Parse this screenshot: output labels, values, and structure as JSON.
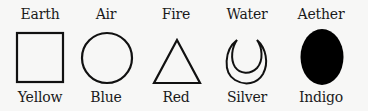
{
  "elements": [
    {
      "name": "Earth",
      "color": "Yellow",
      "symbol": "square",
      "x": 40
    },
    {
      "name": "Air",
      "color": "Blue",
      "symbol": "circle",
      "x": 106
    },
    {
      "name": "Fire",
      "color": "Red",
      "symbol": "triangle",
      "x": 176
    },
    {
      "name": "Water",
      "color": "Silver",
      "symbol": "crescent",
      "x": 247
    },
    {
      "name": "Aether",
      "color": "Indigo",
      "symbol": "filled-ellipse",
      "x": 321
    }
  ]
}
